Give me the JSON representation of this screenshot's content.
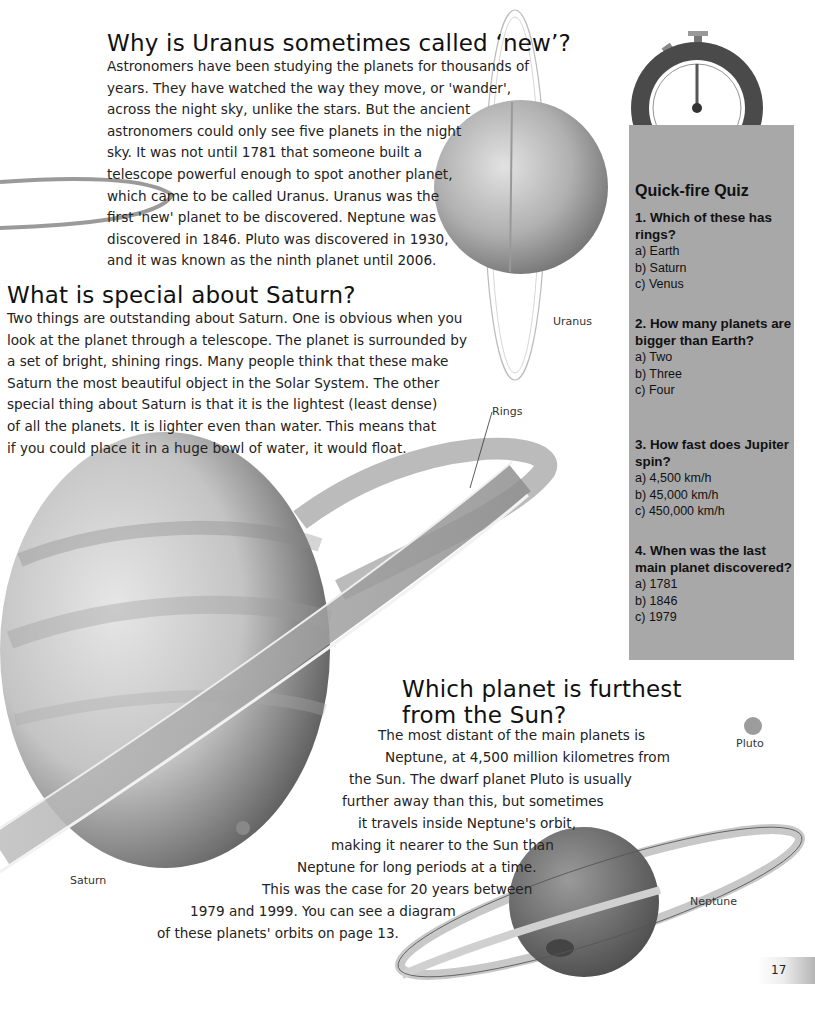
{
  "sections": {
    "uranus": {
      "heading": "Why is Uranus sometimes called ‘new’?",
      "lines": [
        "Astronomers have been studying the planets for thousands of",
        "years. They have watched the way they move, or 'wander',",
        "across the night sky, unlike the stars. But the ancient",
        "astronomers could only see five planets in the night",
        "sky. It was not until 1781 that someone built a",
        "telescope powerful enough to spot another planet,",
        "which came to be called Uranus. Uranus was the",
        "first 'new' planet to be discovered. Neptune was",
        "discovered in 1846. Pluto was discovered in 1930,",
        "and it was known as the ninth planet until 2006."
      ]
    },
    "saturn": {
      "heading": "What is special about Saturn?",
      "lines": [
        "Two things are outstanding about Saturn. One is obvious when you",
        "look at the planet through a telescope. The planet is surrounded by",
        "a set of bright, shining rings. Many people think that these make",
        "Saturn the most beautiful object in the Solar System. The other",
        "special thing about Saturn is that it is the lightest (least dense)",
        "of all the planets. It is lighter even than water. This means that",
        "if you could place it in a huge bowl of water, it would float."
      ]
    },
    "furthest": {
      "heading_lines": [
        "Which planet is furthest",
        "from the Sun?"
      ],
      "lines": [
        "The most distant of the main planets is",
        "Neptune, at 4,500 million kilometres from",
        "the Sun. The dwarf planet Pluto is usually",
        "further away than this, but sometimes",
        "it travels inside Neptune's orbit,",
        "making it nearer to the Sun than",
        "Neptune for long periods at a time.",
        "This was the case for 20 years between",
        "1979 and 1999. You can see a diagram",
        "of these planets' orbits on page 13."
      ]
    }
  },
  "labels": {
    "uranus": "Uranus",
    "rings": "Rings",
    "saturn": "Saturn",
    "pluto": "Pluto",
    "neptune": "Neptune"
  },
  "quiz": {
    "title": "Quick-fire Quiz",
    "icon": "stopwatch-icon",
    "questions": [
      {
        "question": "1. Which of these has rings?",
        "options": [
          "a) Earth",
          "b) Saturn",
          "c) Venus"
        ]
      },
      {
        "question": "2. How many planets are bigger than Earth?",
        "options": [
          "a) Two",
          "b) Three",
          "c) Four"
        ]
      },
      {
        "question": "3. How fast does Jupiter spin?",
        "options": [
          "a) 4,500 km/h",
          "b) 45,000 km/h",
          "c) 450,000 km/h"
        ]
      },
      {
        "question": "4. When was the last main planet discovered?",
        "options": [
          "a) 1781",
          "b) 1846",
          "c) 1979"
        ]
      }
    ]
  },
  "page_number": "17",
  "colors": {
    "quiz_bg": "#a8a8a8",
    "stopwatch_case": "#4a4a4a"
  }
}
